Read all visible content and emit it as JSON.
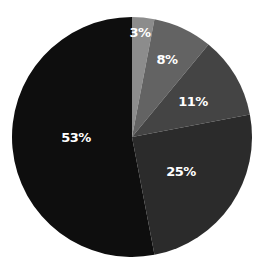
{
  "chart_data": {
    "type": "pie",
    "title": "",
    "start_angle_deg": 0,
    "direction": "clockwise",
    "categories": [
      "3%",
      "8%",
      "11%",
      "25%",
      "53%"
    ],
    "values": [
      3,
      8,
      11,
      25,
      53
    ],
    "labels": [
      "3%",
      "8%",
      "11%",
      "25%",
      "53%"
    ],
    "colors": [
      "#8c8c8c",
      "#636363",
      "#444444",
      "#2b2b2b",
      "#0e0e0e"
    ],
    "legend": null
  },
  "layout": {
    "center_x": 132,
    "center_y": 137,
    "radius": 120,
    "label_positions": [
      {
        "x": 140,
        "y": 37
      },
      {
        "x": 167,
        "y": 64
      },
      {
        "x": 193,
        "y": 106
      },
      {
        "x": 181,
        "y": 176
      },
      {
        "x": 76,
        "y": 142
      }
    ]
  }
}
